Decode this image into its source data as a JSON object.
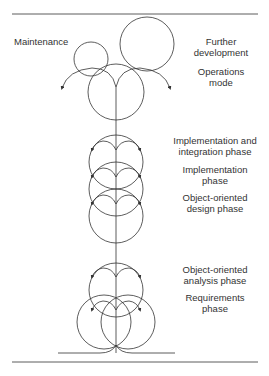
{
  "diagram": {
    "type": "fountain-model",
    "labels": {
      "maintenance": "Maintenance",
      "further_development_1": "Further",
      "further_development_2": "development",
      "operations_1": "Operations",
      "operations_2": "mode",
      "impl_integration_1": "Implementation and",
      "impl_integration_2": "integration phase",
      "implementation_1": "Implementation",
      "implementation_2": "phase",
      "ood_1": "Object-oriented",
      "ood_2": "design phase",
      "ooa_1": "Object-oriented",
      "ooa_2": "analysis phase",
      "requirements_1": "Requirements",
      "requirements_2": "phase"
    },
    "colors": {
      "stroke": "#333333",
      "text": "#333333"
    }
  }
}
